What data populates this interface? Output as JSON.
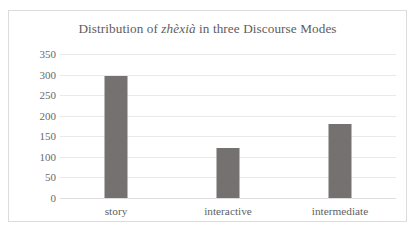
{
  "chart_data": {
    "type": "bar",
    "title": "Distribution of zhèxià in three Discourse Modes",
    "title_parts": {
      "before": "Distribution of ",
      "italic": "zhèxià",
      "after": " in three Discourse Modes"
    },
    "categories": [
      "story",
      "interactive",
      "intermediate"
    ],
    "values": [
      297,
      122,
      179
    ],
    "series": [
      {
        "name": "zhèxià count",
        "values": [
          297,
          122,
          179
        ]
      }
    ],
    "xlabel": "",
    "ylabel": "",
    "ylim": [
      0,
      350
    ],
    "ytick_step": 50,
    "yticks": [
      0,
      50,
      100,
      150,
      200,
      250,
      300,
      350
    ],
    "ytick_labels": [
      "0",
      "50",
      "100",
      "150",
      "200",
      "250",
      "300",
      "350"
    ],
    "grid": true,
    "grid_axis": "y",
    "legend": false,
    "legend_position": "none",
    "bar_color": "#767171",
    "gridline_color": "#e9e9e9",
    "border_color": "#dcdcdc",
    "title_color": "#5d5d5d",
    "tick_label_color": "#6a6a6a"
  }
}
